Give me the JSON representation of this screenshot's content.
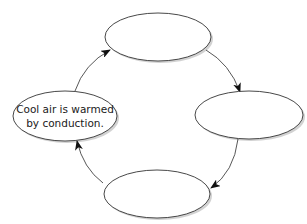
{
  "diagram": {
    "type": "cycle",
    "colors": {
      "stroke": "#333333",
      "fill": "#ffffff",
      "shadow": "#bdbdbd",
      "text": "#1a1a1a"
    },
    "nodes": [
      {
        "id": "top",
        "position": "top",
        "text_line1": "",
        "text_line2": ""
      },
      {
        "id": "right",
        "position": "right",
        "text_line1": "",
        "text_line2": ""
      },
      {
        "id": "bottom",
        "position": "bottom",
        "text_line1": "",
        "text_line2": ""
      },
      {
        "id": "left",
        "position": "left",
        "text_line1": "Cool air is warmed",
        "text_line2": "by conduction."
      }
    ],
    "edges": [
      {
        "from": "left",
        "to": "top"
      },
      {
        "from": "top",
        "to": "right"
      },
      {
        "from": "right",
        "to": "bottom"
      },
      {
        "from": "bottom",
        "to": "left"
      }
    ]
  }
}
